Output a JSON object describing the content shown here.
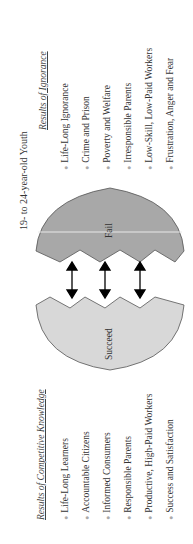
{
  "title": "19- to 24-year-old Youth",
  "ignorance": {
    "heading": "Results of Ignorance",
    "items": [
      "Life-Long Ignorance",
      "Crime and Prison",
      "Poverty and Welfare",
      "Irresponsible Parents",
      "Low-Skill, Low-Paid Workers",
      "Frustration, Anger and Fear"
    ]
  },
  "knowledge": {
    "heading": "Results of Competitive Knowledge",
    "items": [
      "Life-Long Learners",
      "Accountable Citizens",
      "Informed Consumers",
      "Responsible Parents",
      "Productive, High-Paid Workers",
      "Success and Satisfaction"
    ]
  },
  "shapes": {
    "fail_label": "Fail",
    "succeed_label": "Succeed",
    "fail_color": "#a8a8a8",
    "succeed_color": "#d8d8d8"
  }
}
